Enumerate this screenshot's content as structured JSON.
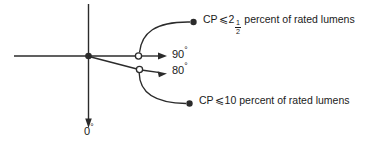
{
  "figure": {
    "type": "diagram",
    "background_color": "#ffffff",
    "line_color": "#2b2b2b",
    "text_color": "#1a1a1a"
  },
  "axes": {
    "vertical": {
      "label": "0",
      "degree_symbol": "°",
      "arrow_direction": "down"
    },
    "horizontal": {
      "label": "",
      "arrow_direction": "none"
    },
    "origin_marker": "filled-dot"
  },
  "rays": [
    {
      "id": "ray-90",
      "angle_label": "90",
      "degree_symbol": "°",
      "node_marker": "open-circle",
      "arrow_direction": "right"
    },
    {
      "id": "ray-80",
      "angle_label": "80",
      "degree_symbol": "°",
      "node_marker": "open-circle",
      "arrow_direction": "right"
    }
  ],
  "callouts": [
    {
      "id": "callout-upper",
      "prefix": "CP",
      "relation": "⩽",
      "value_whole": "2",
      "value_numerator": "1",
      "value_denominator": "2",
      "suffix": "percent of rated lumens",
      "endpoint_marker": "filled-dot",
      "leader": "arc"
    },
    {
      "id": "callout-lower",
      "prefix": "CP",
      "relation": "⩽",
      "value_whole": "10",
      "value_numerator": "",
      "value_denominator": "",
      "suffix": "percent of rated lumens",
      "endpoint_marker": "filled-dot",
      "leader": "arc"
    }
  ]
}
